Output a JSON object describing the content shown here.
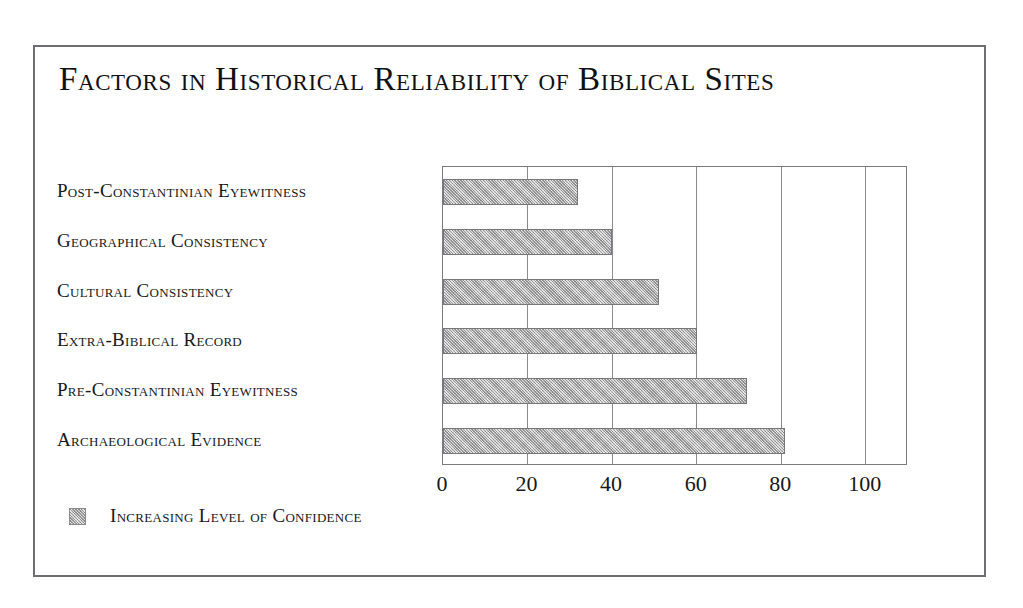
{
  "figure": {
    "title": "Factors in Historical Reliability of Biblical Sites"
  },
  "legend": {
    "swatch_name": "confidence-swatch",
    "label": "Increasing Level of Confidence",
    "position": "below-axis-left"
  },
  "colors": {
    "bar_fill": "#b4b4b4",
    "bar_border": "#777779",
    "frame_border": "#6e6e72",
    "gridline": "#8a8a8e",
    "text": "#18181b",
    "background": "#ffffff"
  },
  "chart_data": {
    "type": "bar",
    "orientation": "horizontal",
    "title": "Factors in Historical Reliability of Biblical Sites",
    "xlabel": "",
    "ylabel": "",
    "xlim": [
      0,
      110
    ],
    "ylim": null,
    "grid": true,
    "gridlines_x": [
      0,
      20,
      40,
      60,
      80,
      100
    ],
    "xticks": [
      0,
      20,
      40,
      60,
      80,
      100
    ],
    "xticklabels": [
      "0",
      "20",
      "40",
      "60",
      "80",
      "100"
    ],
    "legend_position": "below-left",
    "series_name": "Increasing Level of Confidence",
    "categories": [
      "Post-Constantinian Eyewitness",
      "Geographical Consistency",
      "Cultural Consistency",
      "Extra-Biblical Record",
      "Pre-Constantinian Eyewitness",
      "Archaeological Evidence"
    ],
    "values": [
      32,
      40,
      51,
      60,
      72,
      81
    ]
  }
}
